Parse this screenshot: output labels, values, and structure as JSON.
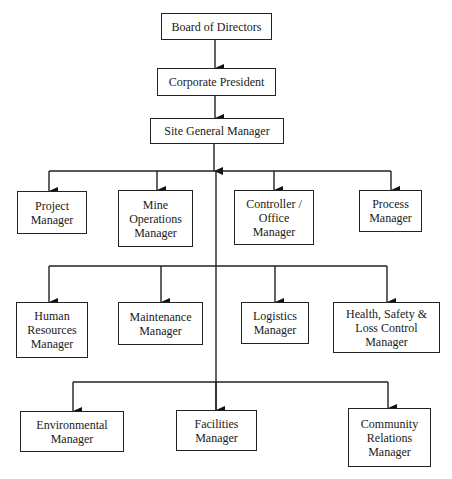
{
  "diagram": {
    "type": "org-chart",
    "nodes": {
      "board": "Board of Directors",
      "president": "Corporate President",
      "site_gm": "Site General Manager",
      "project": "Project Manager",
      "mine_ops": "Mine Operations Manager",
      "controller": "Controller / Office Manager",
      "process": "Process Manager",
      "hr": "Human Resources Manager",
      "maintenance": "Maintenance Manager",
      "logistics": "Logistics Manager",
      "hse": "Health, Safety & Loss Control Manager",
      "environmental": "Environmental Manager",
      "facilities": "Facilities Manager",
      "community": "Community Relations Manager"
    },
    "labels": {
      "board": [
        "Board of Directors"
      ],
      "president": [
        "Corporate President"
      ],
      "site_gm": [
        "Site General Manager"
      ],
      "project": [
        "Project",
        "Manager"
      ],
      "mine_ops": [
        "Mine",
        "Operations",
        "Manager"
      ],
      "controller": [
        "Controller /",
        "Office",
        "Manager"
      ],
      "process": [
        "Process",
        "Manager"
      ],
      "hr": [
        "Human",
        "Resources",
        "Manager"
      ],
      "maintenance": [
        "Maintenance",
        "Manager"
      ],
      "logistics": [
        "Logistics",
        "Manager"
      ],
      "hse": [
        "Health, Safety &",
        "Loss Control",
        "Manager"
      ],
      "environmental": [
        "Environmental",
        "Manager"
      ],
      "facilities": [
        "Facilities",
        "Manager"
      ],
      "community": [
        "Community",
        "Relations",
        "Manager"
      ]
    },
    "edges": [
      [
        "board",
        "president"
      ],
      [
        "president",
        "site_gm"
      ],
      [
        "site_gm",
        "project"
      ],
      [
        "site_gm",
        "mine_ops"
      ],
      [
        "site_gm",
        "controller"
      ],
      [
        "site_gm",
        "process"
      ],
      [
        "site_gm",
        "hr"
      ],
      [
        "site_gm",
        "maintenance"
      ],
      [
        "site_gm",
        "logistics"
      ],
      [
        "site_gm",
        "hse"
      ],
      [
        "site_gm",
        "environmental"
      ],
      [
        "site_gm",
        "facilities"
      ],
      [
        "site_gm",
        "community"
      ]
    ]
  }
}
